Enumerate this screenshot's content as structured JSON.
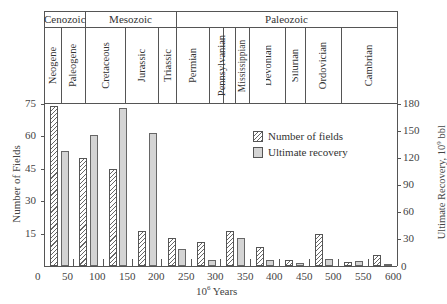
{
  "chart_data": {
    "type": "bar",
    "title": "",
    "xlabel": "10^6 Years",
    "ylabel": "Number of Fields",
    "y2label": "Ultimate Recovery, 10^9 bbl",
    "xlim": [
      0,
      600
    ],
    "ylim": [
      0,
      75
    ],
    "y2lim": [
      0,
      180
    ],
    "x_ticks": [
      0,
      50,
      100,
      150,
      200,
      250,
      300,
      350,
      400,
      450,
      500,
      550,
      600
    ],
    "y_ticks": [
      15,
      30,
      45,
      60,
      75
    ],
    "y2_ticks": [
      0,
      30,
      60,
      90,
      120,
      150,
      180
    ],
    "grid": false,
    "legend_position": "upper right inside plot",
    "categories": [
      "Neogene",
      "Paleogene",
      "Cretaceous",
      "Jurassic",
      "Triassic",
      "Permian",
      "Pennsylvanian",
      "Mississippian",
      "Devonian",
      "Silurian",
      "Ordovician",
      "Cambrian"
    ],
    "eras": [
      {
        "name": "Cenozoic",
        "periods": [
          "Neogene",
          "Paleogene"
        ]
      },
      {
        "name": "Mesozoic",
        "periods": [
          "Cretaceous",
          "Jurassic",
          "Triassic"
        ]
      },
      {
        "name": "Paleozoic",
        "periods": [
          "Permian",
          "Pennsylvanian",
          "Mississippian",
          "Devonian",
          "Silurian",
          "Ordovician",
          "Cambrian"
        ]
      }
    ],
    "bin_starts_myr": [
      0,
      50,
      100,
      150,
      200,
      250,
      300,
      350,
      400,
      450,
      500,
      550
    ],
    "series": [
      {
        "name": "Number of fields",
        "axis": "left",
        "pattern": "hatched",
        "values": [
          74,
          50,
          45,
          16,
          13,
          11,
          16,
          9,
          3,
          15,
          2,
          5
        ]
      },
      {
        "name": "Ultimate recovery",
        "axis": "right",
        "pattern": "dotted",
        "values": [
          128,
          146,
          176,
          148,
          19,
          7,
          31,
          7,
          3,
          8,
          5,
          2
        ]
      }
    ]
  },
  "header": {
    "eras": [
      {
        "label": "Cenozoic"
      },
      {
        "label": "Mesozoic"
      },
      {
        "label": "Paleozoic"
      }
    ],
    "periods": [
      {
        "label": "Neogene"
      },
      {
        "label": "Paleogene"
      },
      {
        "label": "Cretaceous"
      },
      {
        "label": "Jurassic"
      },
      {
        "label": "Triassic"
      },
      {
        "label": "Permian"
      },
      {
        "label": "Pennsylvanian"
      },
      {
        "label": "Mississippian"
      },
      {
        "label": "Devonian"
      },
      {
        "label": "Silurian"
      },
      {
        "label": "Ordovician"
      },
      {
        "label": "Cambrian"
      }
    ]
  },
  "axes": {
    "left_label": "Number of Fields",
    "right_label": "Ultimate Recovery, 10",
    "right_label_sup": "9",
    "right_label_unit": " bbl",
    "x_label_base": "10",
    "x_label_sup": "6",
    "x_label_unit": " Years",
    "left_ticks": [
      "75",
      "60",
      "45",
      "30",
      "15"
    ],
    "right_ticks": [
      "180",
      "150",
      "120",
      "90",
      "60",
      "30",
      "0"
    ],
    "x_ticks": [
      "0",
      "50",
      "100",
      "150",
      "200",
      "250",
      "300",
      "350",
      "400",
      "450",
      "500",
      "550",
      "600"
    ]
  },
  "legend": {
    "fields_label": "Number of fields",
    "recovery_label": "Ultimate recovery"
  }
}
